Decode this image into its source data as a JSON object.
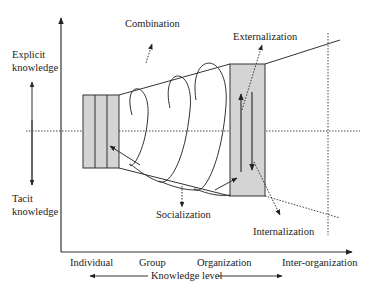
{
  "y_axis": {
    "top_label_line1": "Explicit",
    "top_label_line2": "knowledge",
    "bottom_label_line1": "Tacit",
    "bottom_label_line2": "knowledge"
  },
  "x_axis": {
    "levels": [
      "Individual",
      "Group",
      "Organization",
      "Inter-organization"
    ],
    "title": "Knowledge level"
  },
  "processes": {
    "combination": "Combination",
    "externalization": "Externalization",
    "socialization": "Socialization",
    "internalization": "Internalization"
  },
  "colors": {
    "line": "#333333",
    "box_fill": "#d4d4d4",
    "background": "#ffffff"
  }
}
